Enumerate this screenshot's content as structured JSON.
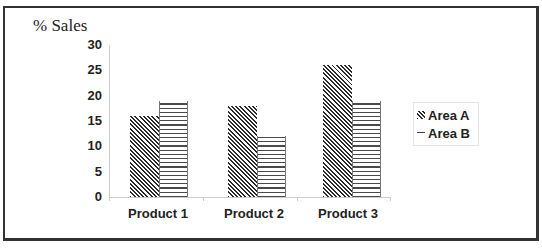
{
  "chart_data": {
    "type": "bar",
    "title": "",
    "ylabel": "% Sales",
    "xlabel": "",
    "categories": [
      "Product 1",
      "Product 2",
      "Product 3"
    ],
    "series": [
      {
        "name": "Area A",
        "pattern": "diagonal-hatch",
        "values": [
          16,
          18,
          26
        ]
      },
      {
        "name": "Area B",
        "pattern": "horizontal-lines",
        "values": [
          19,
          12,
          19
        ]
      }
    ],
    "ylim": [
      0,
      30
    ],
    "yticks": [
      "0",
      "5",
      "10",
      "15",
      "20",
      "25",
      "30"
    ],
    "grid": false,
    "legend_position": "right"
  },
  "colors": {
    "frame": "#333333",
    "axis": "#cccccc",
    "text": "#222222"
  }
}
